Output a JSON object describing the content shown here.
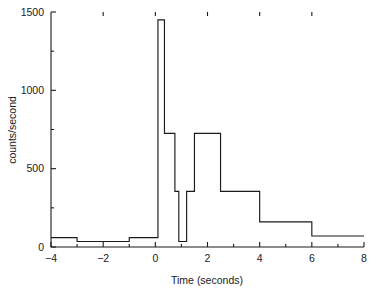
{
  "chart_data": {
    "type": "line",
    "subtype": "step-histogram",
    "title": "",
    "xlabel": "Time (seconds)",
    "ylabel": "counts/second",
    "xlim": [
      -4,
      8
    ],
    "ylim": [
      0,
      1500
    ],
    "grid": false,
    "legend": null,
    "x_ticks": [
      -4,
      -2,
      0,
      2,
      4,
      6,
      8
    ],
    "x_tick_labels": [
      "−4",
      "−2",
      "0",
      "2",
      "4",
      "6",
      "8"
    ],
    "x_minor_ticks": [
      -3,
      -1,
      1,
      3,
      5,
      7
    ],
    "y_ticks": [
      0,
      500,
      1000,
      1500
    ],
    "y_tick_labels": [
      "0",
      "500",
      "1000",
      "1500"
    ],
    "y_minor_ticks": [
      250,
      750,
      1250
    ],
    "line_color": "#1a1a1a",
    "background_color": "#ffffff",
    "steps": [
      {
        "x_start": -4.0,
        "x_end": -3.0,
        "value": 60
      },
      {
        "x_start": -3.0,
        "x_end": -1.0,
        "value": 35
      },
      {
        "x_start": -1.0,
        "x_end": 0.1,
        "value": 60
      },
      {
        "x_start": 0.1,
        "x_end": 0.35,
        "value": 1450
      },
      {
        "x_start": 0.35,
        "x_end": 0.75,
        "value": 725
      },
      {
        "x_start": 0.75,
        "x_end": 0.9,
        "value": 355
      },
      {
        "x_start": 0.9,
        "x_end": 1.2,
        "value": 35
      },
      {
        "x_start": 1.2,
        "x_end": 1.5,
        "value": 355
      },
      {
        "x_start": 1.5,
        "x_end": 2.5,
        "value": 725
      },
      {
        "x_start": 2.5,
        "x_end": 4.0,
        "value": 355
      },
      {
        "x_start": 4.0,
        "x_end": 6.0,
        "value": 160
      },
      {
        "x_start": 6.0,
        "x_end": 8.0,
        "value": 70
      }
    ]
  }
}
